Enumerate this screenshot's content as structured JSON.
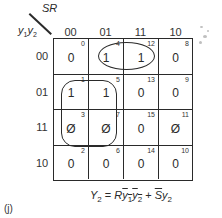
{
  "figure_label": "(j)",
  "kmap": {
    "column_variable": "SR",
    "row_variable_1": "y",
    "row_variable_1_sub": "1",
    "row_variable_2": "y",
    "row_variable_2_sub": "2",
    "columns": [
      "00",
      "01",
      "11",
      "10"
    ],
    "rows": [
      "00",
      "01",
      "11",
      "10"
    ],
    "cells": [
      [
        {
          "value": "0",
          "index": "0"
        },
        {
          "value": "1",
          "index": "4"
        },
        {
          "value": "1",
          "index": "12"
        },
        {
          "value": "0",
          "index": "8"
        }
      ],
      [
        {
          "value": "1",
          "index": "1"
        },
        {
          "value": "1",
          "index": "5"
        },
        {
          "value": "0",
          "index": "13"
        },
        {
          "value": "0",
          "index": "9"
        }
      ],
      [
        {
          "value": "Ø",
          "index": "3"
        },
        {
          "value": "Ø",
          "index": "7"
        },
        {
          "value": "0",
          "index": "15"
        },
        {
          "value": "Ø",
          "index": "11"
        }
      ],
      [
        {
          "value": "0",
          "index": "2"
        },
        {
          "value": "0",
          "index": "6"
        },
        {
          "value": "0",
          "index": "14"
        },
        {
          "value": "0",
          "index": "10"
        }
      ]
    ],
    "groups": [
      {
        "name": "R y1' y2'",
        "cells": [
          4,
          12
        ],
        "shape": "oval"
      },
      {
        "name": "S' y2",
        "cells": [
          1,
          5,
          3,
          7
        ],
        "shape": "rounded-rect"
      }
    ]
  },
  "equation": {
    "lhs": "Y",
    "lhs_sub": "2",
    "equals": " = ",
    "term1_R": "R",
    "term1_y1": "y",
    "term1_y1_sub": "1",
    "term1_y2": "y",
    "term1_y2_sub": "2",
    "plus": " + ",
    "term2_S": "S",
    "term2_y": "y",
    "term2_y_sub": "2"
  }
}
